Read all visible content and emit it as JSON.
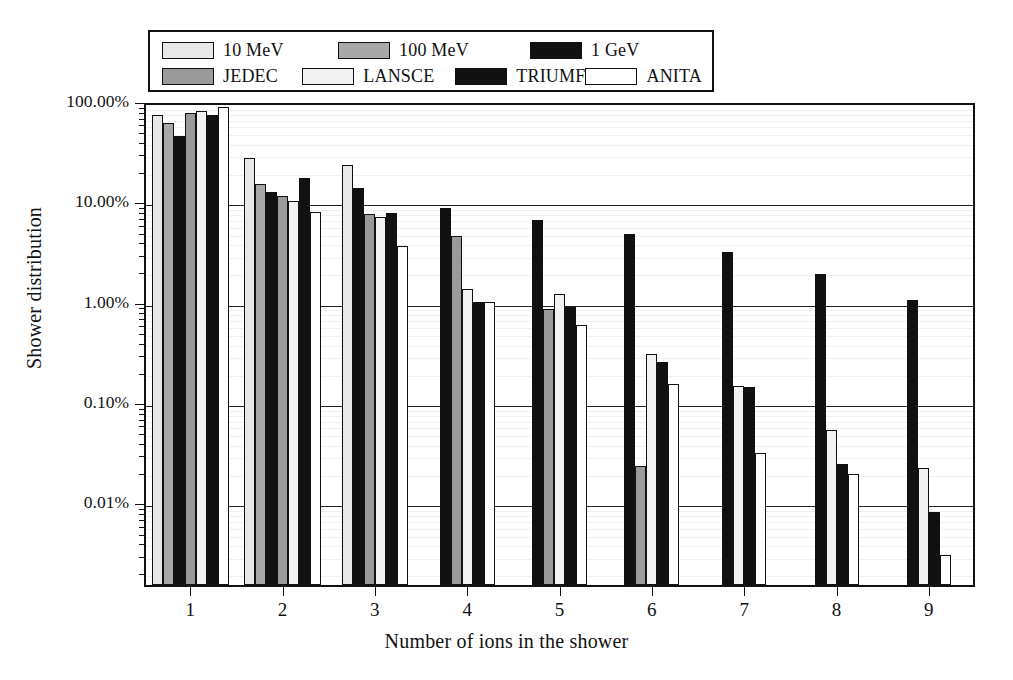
{
  "chart_data": {
    "type": "bar",
    "title": "",
    "xlabel": "Number of ions in the shower",
    "ylabel": "Shower distribution",
    "yscale": "log",
    "ylim": [
      0.0015,
      100
    ],
    "ytick_labels": [
      "100.00%",
      "10.00%",
      "1.00%",
      "0.10%",
      "0.01%"
    ],
    "ytick_values": [
      100,
      10,
      1,
      0.1,
      0.01
    ],
    "categories": [
      "1",
      "2",
      "3",
      "4",
      "5",
      "6",
      "7",
      "8",
      "9"
    ],
    "grid": true,
    "legend_position": "top",
    "units": "percent",
    "series": [
      {
        "name": "10 MeV",
        "color": "#e8e8e8",
        "values": [
          72.0,
          27.0,
          23.0,
          null,
          null,
          null,
          null,
          null,
          null
        ]
      },
      {
        "name": "100 MeV",
        "color": "#a8a8a8",
        "values": [
          60.0,
          14.8,
          null,
          null,
          null,
          null,
          null,
          null,
          null
        ]
      },
      {
        "name": "1 GeV",
        "color": "#111111",
        "values": [
          45.0,
          12.3,
          13.5,
          8.5,
          6.5,
          4.7,
          3.1,
          1.9,
          1.05
        ]
      },
      {
        "name": "JEDEC",
        "color": "#9a9a9a",
        "values": [
          76.0,
          11.3,
          7.5,
          4.5,
          0.85,
          0.023,
          null,
          null,
          null
        ]
      },
      {
        "name": "LANSCE",
        "color": "#f2f2f2",
        "values": [
          80.0,
          10.0,
          7.0,
          1.35,
          1.2,
          0.3,
          0.145,
          0.053,
          0.022
        ]
      },
      {
        "name": "TRIUMF",
        "color": "#111111",
        "values": [
          73.0,
          17.0,
          7.7,
          1.0,
          0.88,
          0.25,
          0.14,
          0.024,
          0.008
        ]
      },
      {
        "name": "ANITA",
        "color": "#ffffff",
        "values": [
          88.0,
          7.8,
          3.6,
          1.0,
          0.58,
          0.15,
          0.031,
          0.019,
          0.003
        ]
      }
    ]
  },
  "legend": {
    "rows": [
      [
        {
          "label": "10 MeV",
          "swatch": "#e8e8e8"
        },
        {
          "label": "100 MeV",
          "swatch": "#a8a8a8"
        },
        {
          "label": "1 GeV",
          "swatch": "#111111"
        }
      ],
      [
        {
          "label": "JEDEC",
          "swatch": "#9a9a9a"
        },
        {
          "label": "LANSCE",
          "swatch": "#f2f2f2"
        },
        {
          "label": "TRIUMF",
          "swatch": "#111111"
        },
        {
          "label": "ANITA",
          "swatch": "#ffffff"
        }
      ]
    ]
  },
  "axes": {
    "y_title": "Shower distribution",
    "x_title": "Number of ions in the shower"
  }
}
